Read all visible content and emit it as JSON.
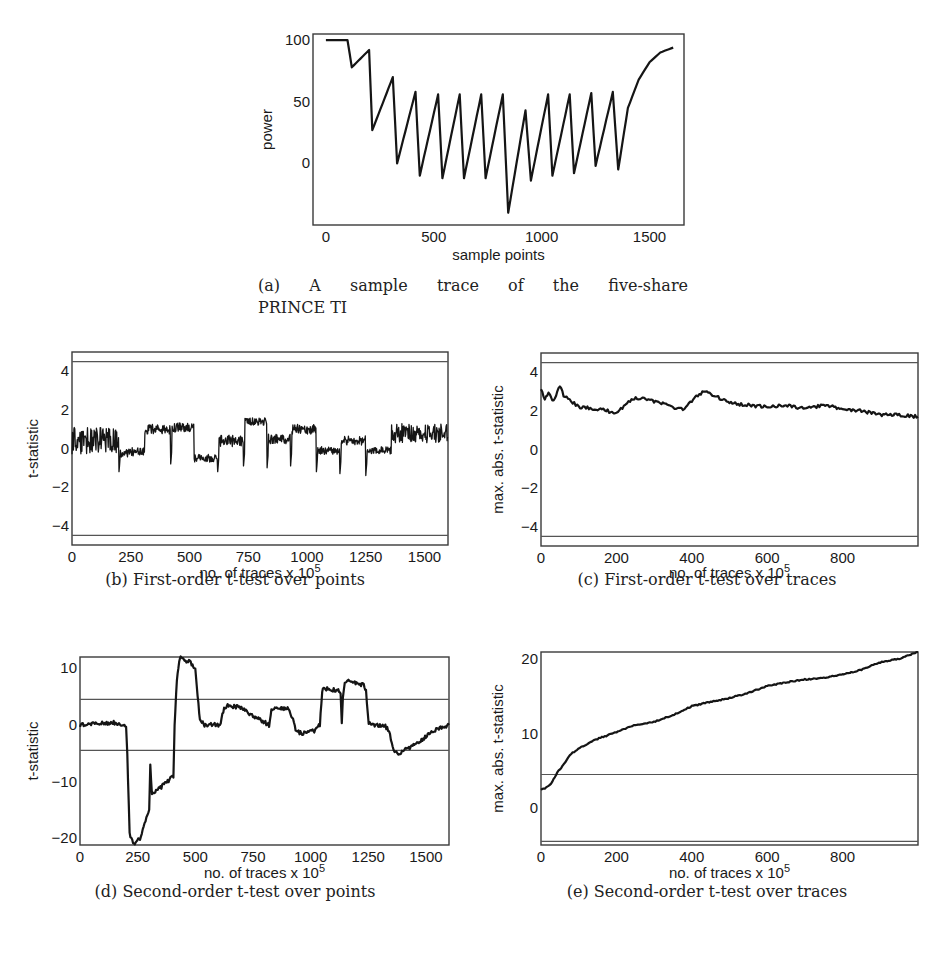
{
  "figure": {
    "captions": {
      "a_line1": "(a) A sample trace of the five-share",
      "a_line2": "PRINCE TI",
      "b": "(b) First-order t-test over points",
      "c": "(c) First-order t-test over traces",
      "d": "(d) Second-order t-test over points",
      "e": "(e) Second-order t-test over traces"
    }
  },
  "chart_data": [
    {
      "id": "a",
      "type": "line",
      "title": "",
      "caption": "(a) A sample trace of the five-share PRINCE TI",
      "xlabel": "sample points",
      "ylabel": "power",
      "xlim": [
        -60,
        1660
      ],
      "ylim": [
        -50,
        105
      ],
      "xticks": [
        0,
        500,
        1000,
        1500
      ],
      "yticks": [
        0,
        50,
        100
      ],
      "grid": false,
      "threshold_lines": [],
      "x": [
        0,
        60,
        100,
        120,
        200,
        215,
        310,
        330,
        415,
        435,
        520,
        540,
        620,
        640,
        720,
        740,
        820,
        845,
        925,
        950,
        1030,
        1050,
        1130,
        1150,
        1230,
        1250,
        1330,
        1355,
        1400,
        1450,
        1500,
        1550,
        1610
      ],
      "values": [
        100,
        100,
        100,
        78,
        92,
        27,
        70,
        0,
        58,
        -10,
        56,
        -12,
        56,
        -12,
        56,
        -12,
        56,
        -40,
        43,
        -14,
        56,
        -10,
        56,
        -8,
        57,
        -2,
        58,
        -5,
        45,
        68,
        82,
        90,
        94
      ]
    },
    {
      "id": "b",
      "type": "line",
      "caption": "(b) First-order t-test over points",
      "xlabel": "no. of traces x 10^5",
      "xlabel_main": "no. of traces x 10",
      "xlabel_sup": "5",
      "ylabel": "t-statistic",
      "xlim": [
        0,
        1600
      ],
      "ylim": [
        -5,
        5
      ],
      "xticks": [
        0,
        250,
        500,
        750,
        1000,
        1250,
        1500
      ],
      "yticks": [
        -4,
        -2,
        0,
        2,
        4
      ],
      "grid": false,
      "threshold_lines": [
        4.5,
        -4.5
      ],
      "segments": [
        {
          "x0": 0,
          "x1": 200,
          "level": 0.4,
          "noise": 0.7
        },
        {
          "x0": 200,
          "x1": 310,
          "level": -0.2,
          "noise": 0.25
        },
        {
          "x0": 310,
          "x1": 420,
          "level": 1.0,
          "noise": 0.25
        },
        {
          "x0": 420,
          "x1": 520,
          "level": 1.1,
          "noise": 0.25
        },
        {
          "x0": 520,
          "x1": 620,
          "level": -0.5,
          "noise": 0.2
        },
        {
          "x0": 620,
          "x1": 730,
          "level": 0.4,
          "noise": 0.3
        },
        {
          "x0": 730,
          "x1": 830,
          "level": 1.4,
          "noise": 0.2
        },
        {
          "x0": 830,
          "x1": 930,
          "level": 0.5,
          "noise": 0.25
        },
        {
          "x0": 930,
          "x1": 1040,
          "level": 1.0,
          "noise": 0.25
        },
        {
          "x0": 1040,
          "x1": 1140,
          "level": -0.1,
          "noise": 0.2
        },
        {
          "x0": 1140,
          "x1": 1250,
          "level": 0.4,
          "noise": 0.25
        },
        {
          "x0": 1250,
          "x1": 1360,
          "level": -0.1,
          "noise": 0.2
        },
        {
          "x0": 1360,
          "x1": 1600,
          "level": 0.8,
          "noise": 0.5
        }
      ],
      "dips": [
        {
          "x": 200,
          "y": -1.2
        },
        {
          "x": 420,
          "y": -0.8
        },
        {
          "x": 620,
          "y": -1.2
        },
        {
          "x": 730,
          "y": -0.9
        },
        {
          "x": 830,
          "y": -1.0
        },
        {
          "x": 930,
          "y": -0.9
        },
        {
          "x": 1040,
          "y": -1.2
        },
        {
          "x": 1140,
          "y": -1.3
        },
        {
          "x": 1250,
          "y": -1.4
        }
      ]
    },
    {
      "id": "c",
      "type": "line",
      "caption": "(c) First-order t-test over traces",
      "xlabel": "no. of traces x 10^5",
      "xlabel_main": "no. of traces x 10",
      "xlabel_sup": "5",
      "ylabel": "max. abs. t-statistic",
      "xlim": [
        0,
        1000
      ],
      "ylim": [
        -5,
        5
      ],
      "xticks": [
        0,
        200,
        400,
        600,
        800
      ],
      "yticks": [
        -4,
        -2,
        0,
        2,
        4
      ],
      "grid": false,
      "threshold_lines": [
        4.5,
        -4.5
      ],
      "x": [
        0,
        10,
        20,
        30,
        40,
        50,
        60,
        80,
        100,
        150,
        200,
        240,
        270,
        300,
        350,
        380,
        420,
        440,
        470,
        500,
        550,
        600,
        650,
        700,
        750,
        800,
        850,
        900,
        950,
        1000
      ],
      "values": [
        3.2,
        2.6,
        3.0,
        2.5,
        2.8,
        3.3,
        2.8,
        2.5,
        2.2,
        2.1,
        1.9,
        2.6,
        2.7,
        2.5,
        2.2,
        2.1,
        2.9,
        3.0,
        2.7,
        2.4,
        2.3,
        2.2,
        2.3,
        2.1,
        2.3,
        2.1,
        2.0,
        1.8,
        1.8,
        1.7
      ]
    },
    {
      "id": "d",
      "type": "line",
      "caption": "(d) Second-order t-test over points",
      "xlabel": "no. of traces x 10^5",
      "xlabel_main": "no. of traces x 10",
      "xlabel_sup": "5",
      "ylabel": "t-statistic",
      "xlim": [
        0,
        1600
      ],
      "ylim": [
        -21.2,
        12
      ],
      "xticks": [
        0,
        250,
        500,
        750,
        1000,
        1250,
        1500
      ],
      "yticks": [
        -20,
        -10,
        0,
        10
      ],
      "grid": false,
      "threshold_lines": [
        4.5,
        -4.5
      ],
      "x": [
        0,
        100,
        150,
        200,
        205,
        215,
        230,
        260,
        300,
        305,
        312,
        322,
        380,
        405,
        410,
        420,
        430,
        440,
        450,
        480,
        500,
        510,
        520,
        540,
        600,
        610,
        625,
        640,
        700,
        750,
        800,
        820,
        830,
        845,
        900,
        920,
        935,
        960,
        1020,
        1040,
        1050,
        1060,
        1120,
        1130,
        1135,
        1140,
        1148,
        1160,
        1230,
        1240,
        1252,
        1270,
        1320,
        1340,
        1360,
        1380,
        1450,
        1500,
        1560,
        1600
      ],
      "values": [
        0,
        0.3,
        0.4,
        0,
        -5,
        -19,
        -21,
        -20,
        -15,
        -7,
        -12.5,
        -12,
        -10,
        -9,
        0,
        8,
        11.5,
        12,
        11.5,
        11,
        10,
        5,
        1,
        0,
        0,
        0.5,
        3,
        3.5,
        3,
        1.5,
        0.5,
        0,
        2.5,
        3.2,
        2.8,
        1.5,
        -1,
        -1.5,
        -1,
        0,
        6,
        6.5,
        6,
        5.5,
        0,
        5,
        7.5,
        8,
        7,
        6,
        0.5,
        0,
        0,
        -1,
        -4.5,
        -5,
        -3.5,
        -2,
        -0.5,
        0
      ]
    },
    {
      "id": "e",
      "type": "line",
      "caption": "(e) Second-order t-test over traces",
      "xlabel": "no. of traces x 10^5",
      "xlabel_main": "no. of traces x 10",
      "xlabel_sup": "5",
      "ylabel": "max. abs. t-statistic",
      "xlim": [
        0,
        1000
      ],
      "ylim": [
        -5,
        21
      ],
      "xticks": [
        0,
        200,
        400,
        600,
        800
      ],
      "yticks": [
        0,
        10,
        20
      ],
      "grid": false,
      "threshold_lines": [
        4.5,
        -4.5
      ],
      "x": [
        0,
        10,
        20,
        30,
        40,
        50,
        60,
        80,
        100,
        150,
        200,
        250,
        300,
        350,
        400,
        450,
        500,
        550,
        600,
        650,
        700,
        750,
        800,
        850,
        900,
        950,
        1000
      ],
      "values": [
        2.5,
        2.6,
        3.0,
        3.5,
        4.5,
        5.2,
        5.8,
        7.3,
        8.0,
        9.3,
        10.2,
        11.2,
        11.6,
        12.5,
        13.7,
        14.3,
        14.8,
        15.5,
        16.4,
        16.9,
        17.3,
        17.5,
        18.0,
        18.6,
        19.6,
        20.1,
        21.0
      ]
    }
  ]
}
